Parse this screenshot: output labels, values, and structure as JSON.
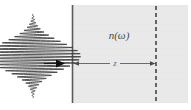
{
  "figure": {
    "background_color": "#ffffff",
    "width": 191,
    "height": 110
  },
  "medium": {
    "label": "n(ω)",
    "fill_color": "#e9e9e9",
    "left_boundary_color": "#5a5a5a",
    "left_boundary_x": 72,
    "right_edge_x": 188,
    "top_y": 5,
    "bottom_y": 103
  },
  "exit_plane": {
    "name": "dashed-exit-plane",
    "x": 156,
    "color": "#4f4f4f",
    "dash": "4 3"
  },
  "distance": {
    "label": "z",
    "y": 63,
    "start_x": 74,
    "end_x": 155,
    "color": "#6a6a6a"
  },
  "pulse": {
    "name": "gaussian-wave-packet",
    "center_x": 33,
    "center_y": 56,
    "envelope_width": 14,
    "amplitude": 48,
    "carrier_period": 3.1,
    "color": "#3d3d3d",
    "propagation_arrow": {
      "label": "",
      "start_x": 44,
      "end_x": 64,
      "y": 63,
      "color": "#1c1c1c"
    }
  }
}
